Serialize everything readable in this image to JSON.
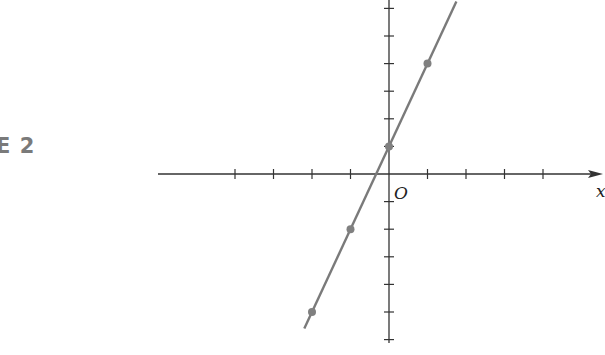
{
  "figure": {
    "label": "E 2"
  },
  "colors": {
    "axis": "#333333",
    "line": "#7a7a7a",
    "point": "#808080"
  },
  "chart_data": {
    "type": "line",
    "title": "",
    "equation": "y = 3x + 1",
    "xlabel": "x",
    "ylabel": "",
    "origin_label": "O",
    "xlim": [
      -6,
      5.5
    ],
    "ylim": [
      -6.2,
      6.3
    ],
    "x_ticks": [
      -4,
      -3,
      -2,
      -1,
      1,
      2,
      3,
      4
    ],
    "y_ticks": [
      -6,
      -5,
      -4,
      -3,
      -2,
      -1,
      1,
      2,
      3,
      4,
      5,
      6
    ],
    "grid": false,
    "series": [
      {
        "name": "line",
        "x": [
          -2.2,
          1.75
        ],
        "y": [
          -5.6,
          6.25
        ]
      }
    ],
    "points": [
      {
        "x": -2,
        "y": -5
      },
      {
        "x": -1,
        "y": -2
      },
      {
        "x": 0,
        "y": 1
      },
      {
        "x": 1,
        "y": 4
      }
    ]
  }
}
